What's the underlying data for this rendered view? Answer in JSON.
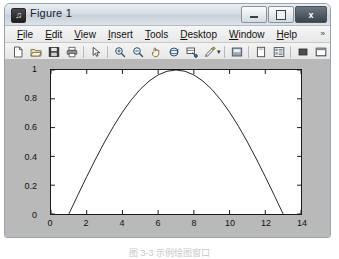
{
  "window": {
    "title": "Figure 1",
    "app_icon": "matlab-figure-icon",
    "controls": {
      "minimize": "minimize-button",
      "maximize": "maximize-button",
      "close_label": "x"
    }
  },
  "menubar": {
    "items": [
      {
        "label": "File",
        "mnemonic": "F"
      },
      {
        "label": "Edit",
        "mnemonic": "E"
      },
      {
        "label": "View",
        "mnemonic": "V"
      },
      {
        "label": "Insert",
        "mnemonic": "I"
      },
      {
        "label": "Tools",
        "mnemonic": "T"
      },
      {
        "label": "Desktop",
        "mnemonic": "D"
      },
      {
        "label": "Window",
        "mnemonic": "W"
      },
      {
        "label": "Help",
        "mnemonic": "H"
      }
    ],
    "overflow": "»"
  },
  "toolbar": {
    "buttons": [
      {
        "name": "new-figure-icon"
      },
      {
        "name": "open-file-icon"
      },
      {
        "name": "save-figure-icon"
      },
      {
        "name": "print-figure-icon"
      },
      {
        "name": "separator"
      },
      {
        "name": "edit-plot-pointer-icon"
      },
      {
        "name": "separator"
      },
      {
        "name": "zoom-in-icon"
      },
      {
        "name": "zoom-out-icon"
      },
      {
        "name": "pan-icon"
      },
      {
        "name": "rotate-3d-icon"
      },
      {
        "name": "data-cursor-icon"
      },
      {
        "name": "brush-data-icon"
      },
      {
        "name": "separator"
      },
      {
        "name": "insert-colorbar-icon"
      },
      {
        "name": "separator"
      },
      {
        "name": "figure-palette-icon"
      },
      {
        "name": "plot-browser-icon"
      },
      {
        "name": "separator"
      },
      {
        "name": "property-editor-icon"
      },
      {
        "name": "dock-figure-icon"
      }
    ]
  },
  "caption": {
    "text": "图 3-3  示例绘图窗口"
  },
  "chart_data": {
    "type": "line",
    "title": "",
    "xlabel": "",
    "ylabel": "",
    "xlim": [
      0,
      14
    ],
    "ylim": [
      0,
      1
    ],
    "xticks": [
      0,
      2,
      4,
      6,
      8,
      10,
      12,
      14
    ],
    "yticks": [
      0,
      0.2,
      0.4,
      0.6,
      0.8,
      1
    ],
    "ytick_labels": [
      "0",
      "0.2",
      "0.4",
      "0.6",
      "0.8",
      "1"
    ],
    "xtick_labels": [
      "0",
      "2",
      "4",
      "6",
      "8",
      "10",
      "12",
      "14"
    ],
    "grid": false,
    "legend": null,
    "series": [
      {
        "name": "curve",
        "color": "#262626",
        "linewidth": 1,
        "x": [
          1.0,
          1.5,
          2.0,
          2.5,
          3.0,
          3.5,
          4.0,
          4.5,
          5.0,
          5.5,
          6.0,
          6.5,
          7.0,
          7.5,
          8.0,
          8.5,
          9.0,
          9.5,
          10.0,
          10.5,
          11.0,
          11.5,
          12.0,
          12.5,
          13.0
        ],
        "y": [
          0.0,
          0.1305,
          0.2588,
          0.3827,
          0.5,
          0.6088,
          0.7071,
          0.7934,
          0.866,
          0.9239,
          0.9659,
          0.9914,
          1.0,
          0.9914,
          0.9659,
          0.9239,
          0.866,
          0.7934,
          0.7071,
          0.6088,
          0.5,
          0.3827,
          0.2588,
          0.1305,
          0.0
        ]
      }
    ]
  }
}
